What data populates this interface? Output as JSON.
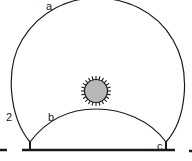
{
  "diagram": {
    "labels": {
      "outer_arc": "a",
      "inner_arc": "b",
      "right_post": "c",
      "figure_number": "2"
    },
    "colors": {
      "line": "#1a1a1a",
      "sun_fill": "#b8b8b8",
      "background": "#ffffff"
    },
    "icons": {
      "center_body": "sun-icon"
    }
  }
}
